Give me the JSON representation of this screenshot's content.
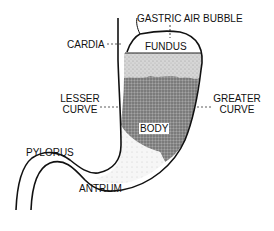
{
  "diagram": {
    "labels": {
      "gastric_air_bubble": "GASTRIC AIR BUBBLE",
      "cardia": "CARDIA",
      "fundus": "FUNDUS",
      "lesser_curve_1": "LESSER",
      "lesser_curve_2": "CURVE",
      "greater_curve_1": "GREATER",
      "greater_curve_2": "CURVE",
      "body": "BODY",
      "pylorus": "PYLORUS",
      "antrum": "ANTRUM"
    },
    "colors": {
      "outline": "#111111",
      "shading_dark": "#8a8a8a",
      "shading_light": "#d4d4d4",
      "background": "#ffffff"
    }
  }
}
